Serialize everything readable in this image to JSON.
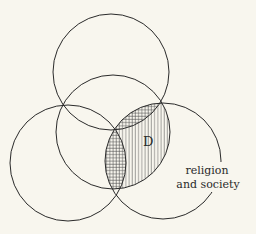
{
  "diagram": {
    "type": "venn",
    "circles": [
      {
        "id": "top",
        "cx": 111,
        "cy": 72,
        "r": 58
      },
      {
        "id": "middle",
        "cx": 113,
        "cy": 132,
        "r": 57
      },
      {
        "id": "left",
        "cx": 68,
        "cy": 163,
        "r": 58
      },
      {
        "id": "right",
        "cx": 163,
        "cy": 161,
        "r": 58
      }
    ],
    "labels": {
      "region_d": "D",
      "right_circle_line1": "religion",
      "right_circle_line2": "and society"
    },
    "colors": {
      "background": "#f8f6ee",
      "stroke": "#2a2a2a"
    }
  }
}
